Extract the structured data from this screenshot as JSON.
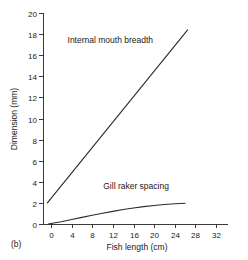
{
  "panel": {
    "label": "(b)"
  },
  "chart_data": {
    "type": "line",
    "title": "",
    "xlabel": "Fish length (cm)",
    "ylabel": "Dimension (mm)",
    "xlim": [
      -2,
      33
    ],
    "ylim": [
      0,
      20
    ],
    "xticks": [
      0,
      4,
      8,
      12,
      16,
      20,
      24,
      28,
      32
    ],
    "xticklabels": [
      "0",
      "4",
      "8",
      "12",
      "16",
      "20",
      "24",
      "28",
      "32"
    ],
    "yticks": [
      0,
      2,
      4,
      6,
      8,
      10,
      12,
      14,
      16,
      18,
      20
    ],
    "yticklabels": [
      "0",
      "2",
      "4",
      "6",
      "8",
      "10",
      "12",
      "14",
      "16",
      "18",
      "20"
    ],
    "grid": false,
    "legend_position": "inline-annotations",
    "series": [
      {
        "name": "Internal mouth breadth",
        "shape": "straight-line",
        "x": [
          -0.7,
          26.5
        ],
        "y": [
          2.0,
          18.4
        ],
        "annotation": "Internal mouth breadth",
        "annotation_x": 11.5,
        "annotation_y": 17.2
      },
      {
        "name": "Gill raker spacing",
        "shape": "concave-curve",
        "x": [
          -0.5,
          0,
          2,
          4,
          6,
          8,
          10,
          12,
          14,
          16,
          18,
          20,
          22,
          24,
          26
        ],
        "y": [
          0.0,
          0.05,
          0.22,
          0.42,
          0.63,
          0.83,
          1.02,
          1.2,
          1.37,
          1.52,
          1.65,
          1.76,
          1.85,
          1.92,
          1.96
        ],
        "annotation": "Gill raker spacing",
        "annotation_x": 16.5,
        "annotation_y": 3.3
      }
    ]
  }
}
